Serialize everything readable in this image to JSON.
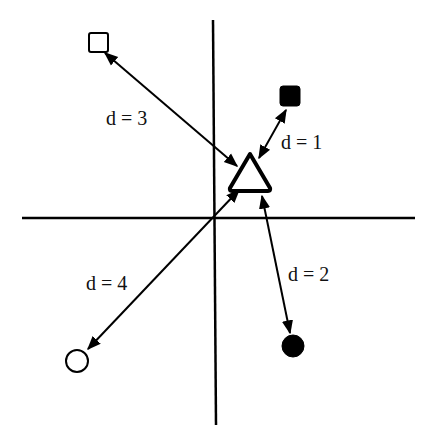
{
  "figure": {
    "colors": {
      "stroke": "#000000",
      "background": "#ffffff",
      "filled": "#000000",
      "hollow": "#ffffff"
    },
    "axes": {
      "horizontal": {
        "x1": 22,
        "y1": 218,
        "x2": 415,
        "y2": 218
      },
      "vertical": {
        "x1": 213,
        "y1": 20,
        "x2": 216,
        "y2": 425
      }
    },
    "query": {
      "shape": "triangle",
      "fill": "hollow",
      "cx": 250,
      "cy": 174
    },
    "neighbors": [
      {
        "id": "filled-square",
        "shape": "square",
        "fill": "filled",
        "cx": 290,
        "cy": 97,
        "distance_label": "d = 1"
      },
      {
        "id": "filled-circle",
        "shape": "circle",
        "fill": "filled",
        "cx": 293,
        "cy": 346,
        "distance_label": "d = 2"
      },
      {
        "id": "hollow-square",
        "shape": "square",
        "fill": "hollow",
        "cx": 98,
        "cy": 42,
        "distance_label": "d = 3"
      },
      {
        "id": "hollow-circle",
        "shape": "circle",
        "fill": "hollow",
        "cx": 77,
        "cy": 361,
        "distance_label": "d = 4"
      }
    ],
    "labels": {
      "d1": "d = 1",
      "d2": "d = 2",
      "d3": "d = 3",
      "d4": "d = 4"
    }
  }
}
